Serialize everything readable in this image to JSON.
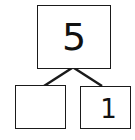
{
  "number_bond": {
    "whole": "5",
    "parts": [
      {
        "value": ""
      },
      {
        "value": "1"
      }
    ]
  },
  "colors": {
    "stroke": "#1a1a1a",
    "background": "#ffffff"
  }
}
